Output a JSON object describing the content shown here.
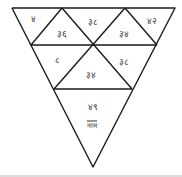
{
  "diagram": {
    "type": "triangle-puzzle",
    "stroke_color": "#1a1a1a",
    "cells": [
      {
        "id": "r1c1",
        "label": "४"
      },
      {
        "id": "r1c2",
        "label": "३६"
      },
      {
        "id": "r1c3",
        "label": "३८"
      },
      {
        "id": "r1c4",
        "label": "३४"
      },
      {
        "id": "r1c5",
        "label": "४२"
      },
      {
        "id": "r2c1",
        "label": "८"
      },
      {
        "id": "r2c2",
        "label": "३४"
      },
      {
        "id": "r2c3",
        "label": "३८"
      },
      {
        "id": "r3c1",
        "label": "४९",
        "sub": "नाम"
      }
    ]
  }
}
